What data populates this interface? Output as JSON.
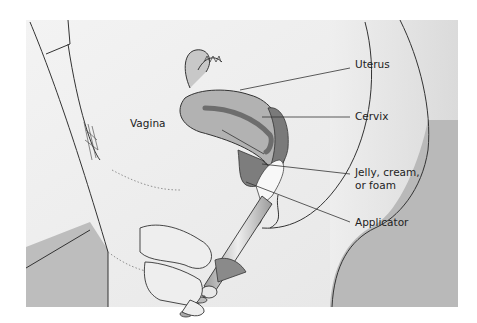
{
  "diagram": {
    "type": "anatomical-illustration",
    "labels": {
      "uterus": "Uterus",
      "cervix": "Cervix",
      "vagina": "Vagina",
      "jelly_line1": "Jelly, cream,",
      "jelly_line2": "or foam",
      "applicator": "Applicator"
    },
    "colors": {
      "background": "#f0f0f0",
      "shadow": "#b8b8b8",
      "organ": "#b5b5b5",
      "organ_dark": "#7a7a7a",
      "stroke": "#333333",
      "applicator": "#d9d9d9",
      "spermicide": "#f8f8f8"
    }
  }
}
